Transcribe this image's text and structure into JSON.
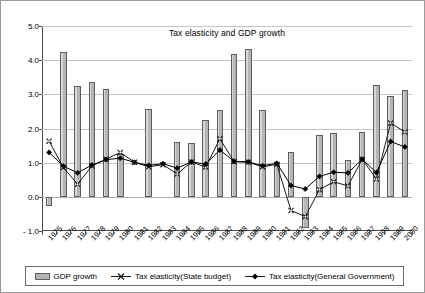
{
  "chart_data": {
    "type": "bar",
    "title": "Tax elasticity and GDP growth",
    "xlabel": "",
    "ylabel": "",
    "ylim": [
      -1.0,
      5.0
    ],
    "ytick_labels": [
      "5.0",
      "4.0",
      "3.0",
      "2.0",
      "1.0",
      "0.0",
      "- 1.0"
    ],
    "ytick_values": [
      5.0,
      4.0,
      3.0,
      2.0,
      1.0,
      0.0,
      -1.0
    ],
    "grid": true,
    "legend_position": "bottom",
    "categories": [
      "1975",
      "1976",
      "1977",
      "1978",
      "1979",
      "1980",
      "1981",
      "1982",
      "1983",
      "1984",
      "1985",
      "1986",
      "1987",
      "1988",
      "1989",
      "1990",
      "1991",
      "1992",
      "1993",
      "1994",
      "1995",
      "1996",
      "1997",
      "1998",
      "1999",
      "2000"
    ],
    "series": [
      {
        "name": "GDP growth",
        "type": "bar",
        "color": "#b5b5b5",
        "values": [
          -0.28,
          4.24,
          3.23,
          3.35,
          3.16,
          1.26,
          0.0,
          2.58,
          0.0,
          1.61,
          1.58,
          2.25,
          2.53,
          4.17,
          4.33,
          2.55,
          1.02,
          1.32,
          -0.92,
          1.8,
          1.86,
          1.08,
          1.9,
          3.27,
          2.94,
          3.12
        ]
      },
      {
        "name": "Tax elasticity(State budget)",
        "type": "line",
        "marker": "x",
        "color": "#1a1a1a",
        "values": [
          1.63,
          0.86,
          0.37,
          0.9,
          1.1,
          1.3,
          1.01,
          0.88,
          0.94,
          0.67,
          1.02,
          0.87,
          1.7,
          1.03,
          1.01,
          0.88,
          0.95,
          -0.4,
          -0.58,
          0.21,
          0.44,
          0.32,
          1.1,
          0.52,
          2.16,
          1.9
        ]
      },
      {
        "name": "Tax elasticity(General Government)",
        "type": "line",
        "marker": "diamond",
        "color": "#000000",
        "values": [
          1.3,
          0.9,
          0.7,
          0.93,
          1.09,
          1.13,
          1.01,
          0.92,
          0.97,
          0.84,
          1.02,
          0.96,
          1.37,
          1.04,
          1.02,
          0.91,
          0.98,
          0.33,
          0.23,
          0.6,
          0.72,
          0.7,
          1.1,
          0.71,
          1.62,
          1.46
        ]
      }
    ]
  },
  "legend": {
    "items": [
      {
        "label": "GDP growth",
        "icon": "bar-swatch-icon"
      },
      {
        "label": "Tax elasticity(State budget)",
        "icon": "x-marker-icon"
      },
      {
        "label": "Tax elasticity(General Government)",
        "icon": "diamond-marker-icon"
      }
    ]
  }
}
